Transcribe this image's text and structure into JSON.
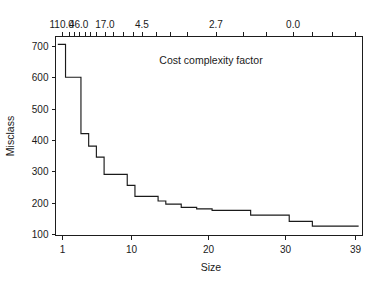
{
  "chart_data": {
    "type": "line",
    "subtype": "step",
    "title": "",
    "annotation": "Cost complexity factor",
    "xlabel": "Size",
    "ylabel": "Misclass",
    "xlim": [
      0.2,
      40.0
    ],
    "ylim": [
      95,
      730
    ],
    "grid": false,
    "legend": null,
    "x_ticks": [
      1,
      10,
      20,
      30,
      39
    ],
    "x_tick_labels": [
      "1",
      "10",
      "20",
      "30",
      "39"
    ],
    "y_ticks": [
      100,
      200,
      300,
      400,
      500,
      600,
      700
    ],
    "y_tick_labels": [
      "100",
      "200",
      "300",
      "400",
      "500",
      "600",
      "700"
    ],
    "top_axis": {
      "label": "Cost complexity factor",
      "tick_labels": [
        "110.0",
        "46.0",
        "17.0",
        "4.5",
        "2.7",
        "0.0"
      ],
      "tick_label_positions_in_size_units": [
        1.0,
        3.2,
        6.6,
        11.4,
        21.0,
        31.0
      ],
      "minor_tick_positions_in_size_units": [
        1.0,
        1.9,
        2.6,
        3.2,
        4.0,
        4.7,
        5.5,
        6.6,
        7.6,
        9.0,
        10.2,
        11.4,
        13.2,
        15.0,
        17.2,
        21.0,
        24.5,
        27.5,
        31.0,
        33.5,
        36.0,
        39.0
      ]
    },
    "x": [
      1,
      2,
      3,
      4,
      5,
      6,
      7,
      8,
      9,
      10,
      11,
      12,
      13,
      14,
      15,
      16,
      17,
      18,
      19,
      20,
      21,
      22,
      23,
      24,
      25,
      26,
      27,
      28,
      29,
      30,
      31,
      32,
      33,
      34,
      35,
      36,
      37,
      38,
      39
    ],
    "values": [
      705,
      600,
      600,
      420,
      380,
      345,
      290,
      290,
      290,
      255,
      220,
      220,
      220,
      205,
      195,
      195,
      185,
      185,
      180,
      180,
      175,
      175,
      175,
      175,
      175,
      160,
      160,
      160,
      160,
      160,
      140,
      140,
      140,
      125,
      125,
      125,
      125,
      125,
      125
    ],
    "series": [
      {
        "name": "Misclass",
        "color": "#1a1a1a",
        "values": [
          705,
          600,
          600,
          420,
          380,
          345,
          290,
          290,
          290,
          255,
          220,
          220,
          220,
          205,
          195,
          195,
          185,
          185,
          180,
          180,
          175,
          175,
          175,
          175,
          175,
          160,
          160,
          160,
          160,
          160,
          140,
          140,
          140,
          125,
          125,
          125,
          125,
          125,
          125
        ]
      }
    ]
  },
  "axes": {
    "y_title": "Misclass",
    "x_title": "Size"
  },
  "style": {
    "line_color": "#1a1a1a",
    "axis_color": "#1d1d1d",
    "background": "#ffffff",
    "text_color": "#1a1a1a"
  }
}
